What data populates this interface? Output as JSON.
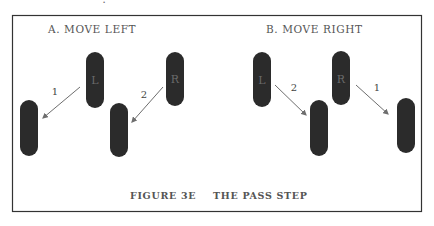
{
  "figure": {
    "caption_label": "FIGURE 3E",
    "caption_title": "THE PASS STEP",
    "top_clipped_glyph": "․",
    "colors": {
      "foot": "#2b2b2b",
      "arrow": "#6e6e6e",
      "border": "#333333",
      "text": "#555555"
    }
  },
  "panels": [
    {
      "title": "A.  MOVE LEFT",
      "feet": [
        {
          "label": "L",
          "position": "start"
        },
        {
          "label": "R",
          "position": "start"
        },
        {
          "label": "",
          "position": "end"
        },
        {
          "label": "",
          "position": "end"
        }
      ],
      "arrows": [
        {
          "step": "1",
          "direction": "down-left",
          "foot": "L"
        },
        {
          "step": "2",
          "direction": "down-left",
          "foot": "R"
        }
      ]
    },
    {
      "title": "B.  MOVE RIGHT",
      "feet": [
        {
          "label": "L",
          "position": "start"
        },
        {
          "label": "R",
          "position": "start"
        },
        {
          "label": "",
          "position": "end"
        },
        {
          "label": "",
          "position": "end"
        }
      ],
      "arrows": [
        {
          "step": "2",
          "direction": "down-right",
          "foot": "L"
        },
        {
          "step": "1",
          "direction": "down-right",
          "foot": "R"
        }
      ]
    }
  ]
}
